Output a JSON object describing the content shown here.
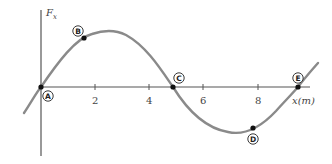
{
  "diagram": {
    "y_axis_label": "F",
    "y_axis_subscript": "x",
    "x_axis_label": "x(m)",
    "x_ticks": [
      "2",
      "4",
      "6",
      "8"
    ],
    "points": [
      {
        "label": "A",
        "x": 0
      },
      {
        "label": "B",
        "x": 1.6
      },
      {
        "label": "C",
        "x": 5
      },
      {
        "label": "D",
        "x": 7.9
      },
      {
        "label": "E",
        "x": 9.2
      }
    ],
    "colors": {
      "curve": "#8a8a8a",
      "axis": "#555555",
      "point": "#111111"
    }
  }
}
